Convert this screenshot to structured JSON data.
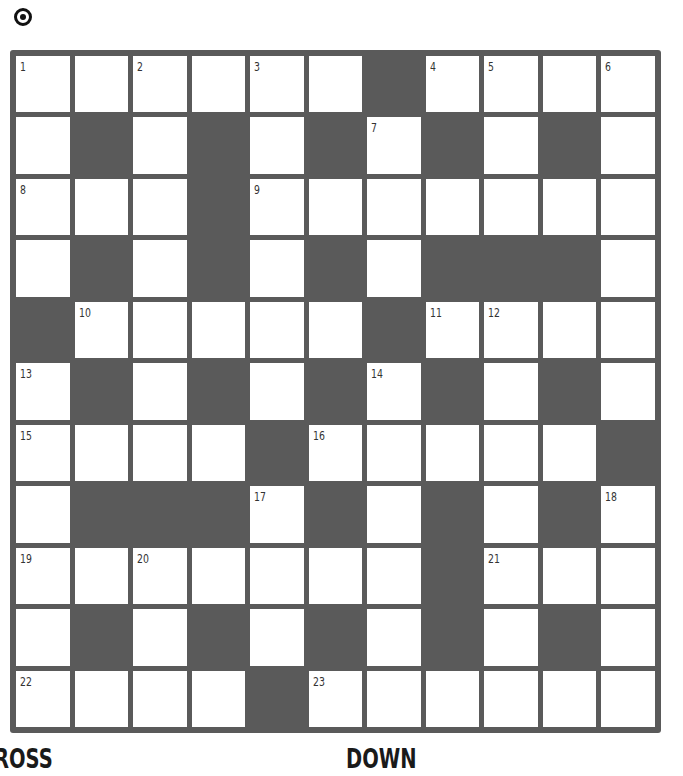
{
  "header": {
    "icon": "target-icon"
  },
  "puzzle": {
    "rows": 11,
    "cols": 11,
    "grid": [
      ".......#....",
      ".#.#.#.#.#.",
      "...#.......",
      ".#.#.#.###.",
      "#.....#....",
      ".#.#.#.#.#.",
      "....#.....#",
      ".###.#.#.#.",
      ".......#...",
      ".#.#.#.#.#.",
      "....#......"
    ],
    "layout": [
      [
        0,
        0,
        0,
        0,
        0,
        0,
        1,
        0,
        0,
        0,
        0
      ],
      [
        0,
        1,
        0,
        1,
        0,
        1,
        0,
        1,
        0,
        1,
        0
      ],
      [
        0,
        0,
        0,
        1,
        0,
        0,
        0,
        0,
        0,
        0,
        0
      ],
      [
        0,
        1,
        0,
        1,
        0,
        1,
        0,
        1,
        1,
        1,
        0
      ],
      [
        1,
        0,
        0,
        0,
        0,
        0,
        1,
        0,
        0,
        0,
        0
      ],
      [
        0,
        1,
        0,
        1,
        0,
        1,
        0,
        1,
        0,
        1,
        0
      ],
      [
        0,
        0,
        0,
        0,
        1,
        0,
        0,
        0,
        0,
        0,
        1
      ],
      [
        0,
        1,
        1,
        1,
        0,
        1,
        0,
        1,
        0,
        1,
        0
      ],
      [
        0,
        0,
        0,
        0,
        0,
        0,
        0,
        1,
        0,
        0,
        0
      ],
      [
        0,
        1,
        0,
        1,
        0,
        1,
        0,
        1,
        0,
        1,
        0
      ],
      [
        0,
        0,
        0,
        0,
        1,
        0,
        0,
        0,
        0,
        0,
        0
      ]
    ],
    "numbers": [
      {
        "n": "1",
        "r": 0,
        "c": 0
      },
      {
        "n": "2",
        "r": 0,
        "c": 2
      },
      {
        "n": "3",
        "r": 0,
        "c": 4
      },
      {
        "n": "4",
        "r": 0,
        "c": 7
      },
      {
        "n": "5",
        "r": 0,
        "c": 8
      },
      {
        "n": "6",
        "r": 0,
        "c": 10
      },
      {
        "n": "7",
        "r": 1,
        "c": 6
      },
      {
        "n": "8",
        "r": 2,
        "c": 0
      },
      {
        "n": "9",
        "r": 2,
        "c": 4
      },
      {
        "n": "10",
        "r": 4,
        "c": 1
      },
      {
        "n": "11",
        "r": 4,
        "c": 7
      },
      {
        "n": "12",
        "r": 4,
        "c": 8
      },
      {
        "n": "13",
        "r": 5,
        "c": 0
      },
      {
        "n": "14",
        "r": 5,
        "c": 6
      },
      {
        "n": "15",
        "r": 6,
        "c": 0
      },
      {
        "n": "16",
        "r": 6,
        "c": 5
      },
      {
        "n": "17",
        "r": 7,
        "c": 4
      },
      {
        "n": "18",
        "r": 7,
        "c": 10
      },
      {
        "n": "19",
        "r": 8,
        "c": 0
      },
      {
        "n": "20",
        "r": 8,
        "c": 2
      },
      {
        "n": "21",
        "r": 8,
        "c": 8
      },
      {
        "n": "22",
        "r": 10,
        "c": 0
      },
      {
        "n": "23",
        "r": 10,
        "c": 5
      }
    ],
    "colors": {
      "block": "#5a5a5a",
      "cell": "#ffffff"
    }
  },
  "clues": {
    "across_label": "ACROSS",
    "across_visible": "ROSS",
    "down_label": "DOWN"
  }
}
